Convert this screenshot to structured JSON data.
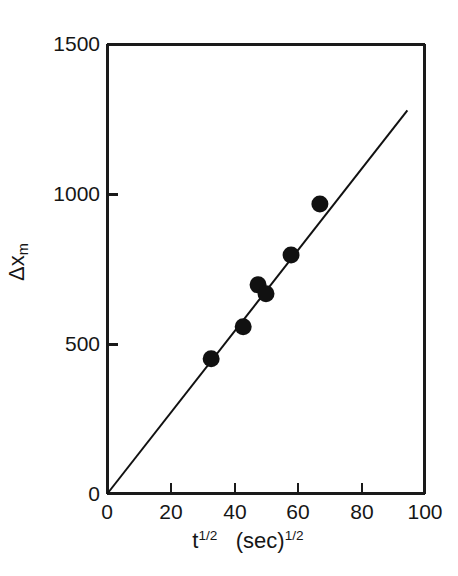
{
  "chart_data": {
    "type": "scatter",
    "title": "",
    "xlabel": "t^1/2 (sec)^1/2",
    "ylabel": "Δx_m",
    "xlim": [
      0,
      100
    ],
    "ylim": [
      0,
      1500
    ],
    "grid": false,
    "legend": "none",
    "x_ticks": [
      0,
      20,
      40,
      60,
      80,
      100
    ],
    "y_ticks": [
      0,
      500,
      1000,
      1500
    ],
    "x_tick_labels": [
      "0",
      "20",
      "40",
      "60",
      "80",
      "100"
    ],
    "y_tick_labels": [
      "0",
      "500",
      "1000",
      "1500"
    ],
    "series": [
      {
        "name": "measurements",
        "marker": "filled-circle",
        "color": "#111111",
        "points": [
          {
            "x": 32.7,
            "y": 450
          },
          {
            "x": 42.8,
            "y": 557
          },
          {
            "x": 47.5,
            "y": 697
          },
          {
            "x": 50.0,
            "y": 667
          },
          {
            "x": 57.9,
            "y": 797
          },
          {
            "x": 67.0,
            "y": 967
          }
        ]
      },
      {
        "name": "linear-fit",
        "type": "line",
        "color": "#111111",
        "slope": 13.53,
        "intercept": 0,
        "x_start": 0,
        "x_end": 94.6,
        "y_start": 0,
        "y_end": 1280
      }
    ]
  },
  "axis": {
    "x_title_main": "t",
    "x_title_main_exp": "1/2",
    "x_title_unit": "(sec)",
    "x_title_unit_exp": "1/2",
    "y_title_delta": "Δx",
    "y_title_sub": "m"
  },
  "style": {
    "axis_color": "#1a1a1a",
    "marker_color": "#111111",
    "background": "#ffffff"
  }
}
